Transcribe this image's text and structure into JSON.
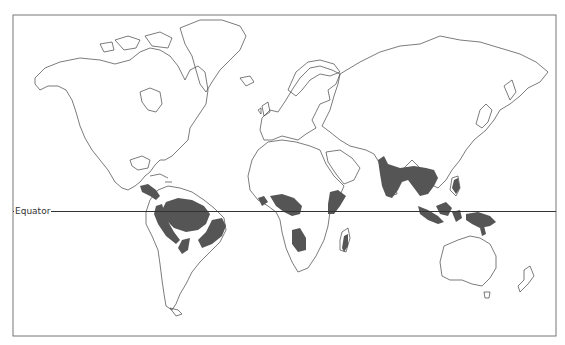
{
  "map": {
    "type": "world-outline",
    "projection": "mercator",
    "title": "",
    "colors": {
      "background": "#ffffff",
      "coastline": "#444444",
      "highlight_fill": "#555555",
      "frame": "#666666",
      "equator_line": "#333333"
    },
    "labels": {
      "equator": "Equator"
    },
    "highlighted_regions": [
      {
        "name": "Central America"
      },
      {
        "name": "Amazon Basin"
      },
      {
        "name": "Atlantic Forest Brazil"
      },
      {
        "name": "Western Africa"
      },
      {
        "name": "Congo Basin"
      },
      {
        "name": "East Africa"
      },
      {
        "name": "South-central Africa"
      },
      {
        "name": "Madagascar"
      },
      {
        "name": "India and Southeast Asia"
      },
      {
        "name": "Indonesia"
      },
      {
        "name": "New Guinea"
      },
      {
        "name": "Philippines"
      }
    ]
  }
}
